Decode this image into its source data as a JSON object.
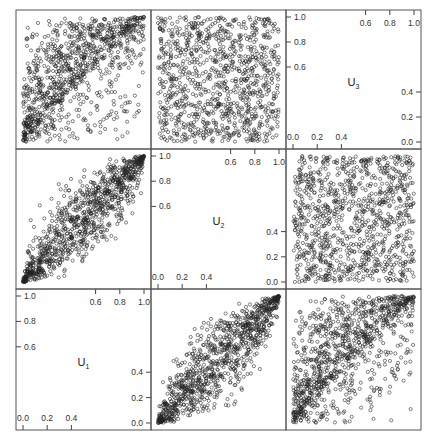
{
  "chart_data": {
    "type": "scatter",
    "layout": "scatterplot-matrix",
    "title": "",
    "variables": [
      {
        "name": "U",
        "subscript": "1",
        "label": "U₁"
      },
      {
        "name": "U",
        "subscript": "2",
        "label": "U₂"
      },
      {
        "name": "U",
        "subscript": "3",
        "label": "U₃"
      }
    ],
    "arrangement": "variable order reversed along diagonal: U3 top-right, U2 center, U1 bottom-left",
    "axis_range": [
      0.0,
      1.0
    ],
    "diag_ticks": {
      "top_axis": [
        "0.6",
        "0.8",
        "1.0"
      ],
      "left_axis": [
        "1.0",
        "0.8",
        "0.6"
      ],
      "bottom_axis": [
        "0.0",
        "0.2",
        "0.4"
      ],
      "right_axis": [
        "0.4",
        "0.2",
        "0.0"
      ]
    },
    "panels": [
      {
        "row": 0,
        "col": 0,
        "x": "U1",
        "y": "U3",
        "pattern": "upper-triangle dependence, moderate positive",
        "rho": 0.55,
        "kind": "triangle"
      },
      {
        "row": 0,
        "col": 1,
        "x": "U2",
        "y": "U3",
        "pattern": "near-independent uniform",
        "rho": 0.0,
        "kind": "uniform"
      },
      {
        "row": 0,
        "col": 2,
        "diagonal": "U3"
      },
      {
        "row": 1,
        "col": 0,
        "x": "U1",
        "y": "U2",
        "pattern": "strong positive linear",
        "rho": 0.9,
        "kind": "band"
      },
      {
        "row": 1,
        "col": 1,
        "diagonal": "U2"
      },
      {
        "row": 1,
        "col": 2,
        "x": "U3",
        "y": "U2",
        "pattern": "near-independent uniform",
        "rho": 0.0,
        "kind": "uniform"
      },
      {
        "row": 2,
        "col": 0,
        "diagonal": "U1"
      },
      {
        "row": 2,
        "col": 1,
        "x": "U2",
        "y": "U1",
        "pattern": "strong positive linear",
        "rho": 0.9,
        "kind": "band"
      },
      {
        "row": 2,
        "col": 2,
        "x": "U3",
        "y": "U1",
        "pattern": "upper-triangle dependence, moderate positive",
        "rho": 0.55,
        "kind": "triangle"
      }
    ],
    "points_per_panel": 1000,
    "marker": "open circle",
    "grid": false,
    "legend": "none"
  },
  "style": {
    "point_color": "#222222",
    "frame_color": "#555555"
  }
}
